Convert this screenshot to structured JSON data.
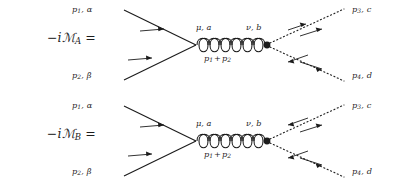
{
  "figure": {
    "type": "feynman-diagram-pair",
    "background_color": "#ffffff",
    "ink_color": "#1c1c1c"
  },
  "diagrams": [
    {
      "id": "A",
      "amplitude": {
        "prefix": "−i",
        "symbol": "ℳ",
        "subscript": "A",
        "equals": "="
      },
      "incoming": [
        {
          "momentum": "p",
          "index": "1",
          "label_tail": ", α",
          "line_style": "solid",
          "arrow_count": 1
        },
        {
          "momentum": "p",
          "index": "2",
          "label_tail": ", β",
          "line_style": "solid",
          "arrow_count": 1
        }
      ],
      "outgoing": [
        {
          "momentum": "p",
          "index": "3",
          "label_tail": ", c",
          "line_style": "dotted",
          "arrow_count": 2
        },
        {
          "momentum": "p",
          "index": "4",
          "label_tail": ", d",
          "line_style": "dotted",
          "arrow_count": 2
        }
      ],
      "propagator": {
        "style": "gluon-coil",
        "coil_count": 6,
        "left_vertex_label": "μ, a",
        "right_vertex_label": "ν, b",
        "momentum_label_lead": "p",
        "momentum_label_lead_sub": "1",
        "momentum_label_op": "+",
        "momentum_label_tail": "p",
        "momentum_label_tail_sub": "2"
      }
    },
    {
      "id": "B",
      "amplitude": {
        "prefix": "−i",
        "symbol": "ℳ",
        "subscript": "B",
        "equals": "="
      },
      "incoming": [
        {
          "momentum": "p",
          "index": "1",
          "label_tail": ", α",
          "line_style": "solid",
          "arrow_count": 1
        },
        {
          "momentum": "p",
          "index": "2",
          "label_tail": ", β",
          "line_style": "solid",
          "arrow_count": 1
        }
      ],
      "outgoing": [
        {
          "momentum": "p",
          "index": "3",
          "label_tail": ", c",
          "line_style": "dotted",
          "arrow_count": 2
        },
        {
          "momentum": "p",
          "index": "4",
          "label_tail": ", d",
          "line_style": "dotted",
          "arrow_count": 2
        }
      ],
      "propagator": {
        "style": "gluon-coil",
        "coil_count": 6,
        "left_vertex_label": "μ, a",
        "right_vertex_label": "ν, b",
        "momentum_label_lead": "p",
        "momentum_label_lead_sub": "1",
        "momentum_label_op": "+",
        "momentum_label_tail": "p",
        "momentum_label_tail_sub": "2"
      }
    }
  ]
}
